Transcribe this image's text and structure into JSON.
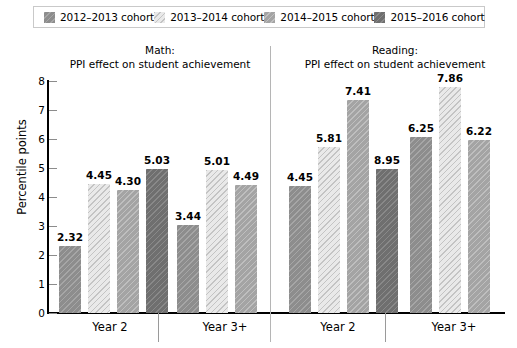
{
  "legend": {
    "items": [
      {
        "label": "2012–2013 cohort",
        "color": "#8d8d8d",
        "swatch_name": "legend-swatch-2012-2013"
      },
      {
        "label": "2013–2014 cohort",
        "color": "#e9e9e9",
        "swatch_name": "legend-swatch-2013-2014"
      },
      {
        "label": "2014–2015 cohort",
        "color": "#a4a4a4",
        "swatch_name": "legend-swatch-2014-2015"
      },
      {
        "label": "2015–2016 cohort",
        "color": "#6f6f6f",
        "swatch_name": "legend-swatch-2015-2016"
      }
    ]
  },
  "panels": {
    "math": {
      "title_line1": "Math:",
      "title_line2": "PPI effect on student achievement"
    },
    "reading": {
      "title_line1": "Reading:",
      "title_line2": "PPI effect on student achievement"
    }
  },
  "axis": {
    "ylabel": "Percentile points",
    "yticks": [
      "0",
      "1",
      "2",
      "3",
      "4",
      "5",
      "6",
      "7",
      "8"
    ],
    "ymin": 0,
    "ymax": 8,
    "group_labels": [
      "Year 2",
      "Year 3+",
      "Year 2",
      "Year 3+"
    ]
  },
  "chart_data": {
    "type": "bar",
    "title": "PPI effect on student achievement",
    "xlabel": "",
    "ylabel": "Percentile points",
    "ylim": [
      0,
      8
    ],
    "yticks": [
      0,
      1,
      2,
      3,
      4,
      5,
      6,
      7,
      8
    ],
    "grid": false,
    "legend_position": "top",
    "panels": [
      "Math",
      "Reading"
    ],
    "categories": [
      "Year 2",
      "Year 3+"
    ],
    "series": [
      {
        "name": "2012–2013 cohort",
        "color": "#8d8d8d"
      },
      {
        "name": "2013–2014 cohort",
        "color": "#e9e9e9"
      },
      {
        "name": "2014–2015 cohort",
        "color": "#a4a4a4"
      },
      {
        "name": "2015–2016 cohort",
        "color": "#6f6f6f"
      }
    ],
    "bars": [
      {
        "panel": "Math",
        "group": "Year 2",
        "series": "2012–2013 cohort",
        "label": "2.32",
        "value": 2.32,
        "cohort": 0
      },
      {
        "panel": "Math",
        "group": "Year 2",
        "series": "2013–2014 cohort",
        "label": "4.45",
        "value": 4.45,
        "cohort": 1
      },
      {
        "panel": "Math",
        "group": "Year 2",
        "series": "2014–2015 cohort",
        "label": "4.30",
        "value": 4.25,
        "cohort": 2
      },
      {
        "panel": "Math",
        "group": "Year 2",
        "series": "2015–2016 cohort",
        "label": "5.03",
        "value": 4.98,
        "cohort": 3
      },
      {
        "panel": "Math",
        "group": "Year 3+",
        "series": "2012–2013 cohort",
        "label": "3.44",
        "value": 3.02,
        "cohort": 0
      },
      {
        "panel": "Math",
        "group": "Year 3+",
        "series": "2013–2014 cohort",
        "label": "5.01",
        "value": 4.93,
        "cohort": 1
      },
      {
        "panel": "Math",
        "group": "Year 3+",
        "series": "2014–2015 cohort",
        "label": "4.49",
        "value": 4.42,
        "cohort": 2
      },
      {
        "panel": "Reading",
        "group": "Year 2",
        "series": "2012–2013 cohort",
        "label": "4.45",
        "value": 4.38,
        "cohort": 0
      },
      {
        "panel": "Reading",
        "group": "Year 2",
        "series": "2013–2014 cohort",
        "label": "5.81",
        "value": 5.73,
        "cohort": 1
      },
      {
        "panel": "Reading",
        "group": "Year 2",
        "series": "2014–2015 cohort",
        "label": "7.41",
        "value": 7.33,
        "cohort": 2
      },
      {
        "panel": "Reading",
        "group": "Year 2",
        "series": "2015–2016 cohort",
        "label": "8.95",
        "value": 4.95,
        "cohort": 3
      },
      {
        "panel": "Reading",
        "group": "Year 3+",
        "series": "2012–2013 cohort",
        "label": "6.25",
        "value": 6.08,
        "cohort": 0
      },
      {
        "panel": "Reading",
        "group": "Year 3+",
        "series": "2013–2014 cohort",
        "label": "7.86",
        "value": 7.78,
        "cohort": 1
      },
      {
        "panel": "Reading",
        "group": "Year 3+",
        "series": "2014–2015 cohort",
        "label": "6.22",
        "value": 5.97,
        "cohort": 2
      }
    ]
  }
}
